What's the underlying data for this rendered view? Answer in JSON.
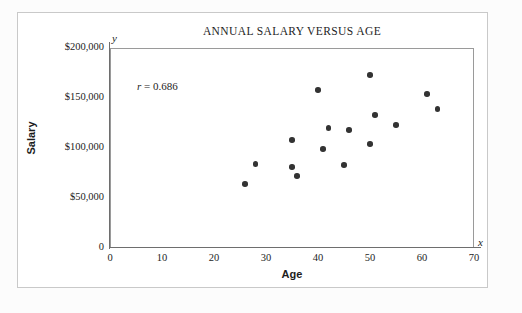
{
  "figure": {
    "title": "ANNUAL SALARY VERSUS AGE",
    "annotation_symbol": "r",
    "annotation_value": " = 0.686",
    "axis_letter_x": "x",
    "axis_letter_y": "y",
    "point_color": "#333333",
    "frame_color": "#9a9a9a",
    "text_color": "#1d1d1d"
  },
  "chart_data": {
    "type": "scatter",
    "title": "ANNUAL SALARY VERSUS AGE",
    "xlabel": "Age",
    "ylabel": "Salary",
    "xlim": [
      0,
      70
    ],
    "ylim": [
      0,
      200000
    ],
    "grid": false,
    "legend": "none",
    "xticks": [
      0,
      10,
      20,
      30,
      40,
      50,
      60,
      70
    ],
    "xticklabels": [
      "0",
      "10",
      "20",
      "30",
      "40",
      "50",
      "60",
      "70"
    ],
    "yticks": [
      0,
      50000,
      100000,
      150000,
      200000
    ],
    "yticklabels": [
      "0",
      "$50,000",
      "$100,000",
      "$150,000",
      "$200,000"
    ],
    "annotations": [
      {
        "text": "r = 0.686",
        "x": 5,
        "y": 165000
      }
    ],
    "correlation_r": 0.686,
    "points": [
      {
        "x": 26,
        "y": 64000
      },
      {
        "x": 28,
        "y": 84000
      },
      {
        "x": 35,
        "y": 108000
      },
      {
        "x": 35,
        "y": 81000
      },
      {
        "x": 36,
        "y": 72000
      },
      {
        "x": 40,
        "y": 158000
      },
      {
        "x": 41,
        "y": 99000
      },
      {
        "x": 42,
        "y": 120000
      },
      {
        "x": 45,
        "y": 83000
      },
      {
        "x": 46,
        "y": 118000
      },
      {
        "x": 50,
        "y": 173000
      },
      {
        "x": 50,
        "y": 104000
      },
      {
        "x": 51,
        "y": 133000
      },
      {
        "x": 55,
        "y": 123000
      },
      {
        "x": 61,
        "y": 154000
      },
      {
        "x": 63,
        "y": 139000
      }
    ]
  }
}
